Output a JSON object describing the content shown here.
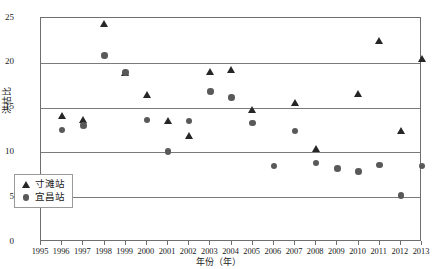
{
  "chart_data": {
    "type": "scatter",
    "title": "",
    "xlabel": "年份（年）",
    "ylabel": "洪枯比",
    "xlim": [
      1995,
      2013
    ],
    "ylim": [
      0,
      25
    ],
    "yticks": [
      0,
      5,
      10,
      15,
      20,
      25
    ],
    "xticks": [
      1995,
      1996,
      1997,
      1998,
      1999,
      2000,
      2001,
      2002,
      2003,
      2004,
      2005,
      2006,
      2007,
      2008,
      2009,
      2010,
      2011,
      2012,
      2013
    ],
    "grid": "horizontal",
    "legend_position": "bottom-left",
    "series": [
      {
        "name": "寸滩站",
        "marker": "triangle",
        "color": "#262626",
        "points": [
          {
            "x": 1996,
            "y": 14.1
          },
          {
            "x": 1997,
            "y": 13.6
          },
          {
            "x": 1998,
            "y": 24.4
          },
          {
            "x": 1999,
            "y": 18.9
          },
          {
            "x": 2000,
            "y": 16.4
          },
          {
            "x": 2001,
            "y": 13.5
          },
          {
            "x": 2002,
            "y": 11.8
          },
          {
            "x": 2003,
            "y": 19.0
          },
          {
            "x": 2004,
            "y": 19.2
          },
          {
            "x": 2005,
            "y": 14.8
          },
          {
            "x": 2007,
            "y": 15.5
          },
          {
            "x": 2008,
            "y": 10.4
          },
          {
            "x": 2010,
            "y": 16.5
          },
          {
            "x": 2011,
            "y": 22.4
          },
          {
            "x": 2012,
            "y": 12.4
          },
          {
            "x": 2013,
            "y": 20.4
          }
        ]
      },
      {
        "name": "宜昌站",
        "marker": "circle",
        "color": "#595959",
        "points": [
          {
            "x": 1996,
            "y": 12.5
          },
          {
            "x": 1997,
            "y": 13.0
          },
          {
            "x": 1998,
            "y": 20.8
          },
          {
            "x": 1999,
            "y": 18.9
          },
          {
            "x": 2000,
            "y": 13.6
          },
          {
            "x": 2001,
            "y": 10.1
          },
          {
            "x": 2002,
            "y": 13.5
          },
          {
            "x": 2003,
            "y": 16.8
          },
          {
            "x": 2004,
            "y": 16.1
          },
          {
            "x": 2005,
            "y": 13.3
          },
          {
            "x": 2006,
            "y": 8.5
          },
          {
            "x": 2007,
            "y": 12.4
          },
          {
            "x": 2008,
            "y": 8.8
          },
          {
            "x": 2009,
            "y": 8.2
          },
          {
            "x": 2010,
            "y": 7.9
          },
          {
            "x": 2011,
            "y": 8.6
          },
          {
            "x": 2012,
            "y": 5.2
          },
          {
            "x": 2013,
            "y": 8.5
          }
        ]
      }
    ]
  },
  "legend": {
    "items": [
      {
        "label": "寸滩站",
        "glyph": "triangle-marker-icon"
      },
      {
        "label": "宜昌站",
        "glyph": "circle-marker-icon"
      }
    ]
  }
}
